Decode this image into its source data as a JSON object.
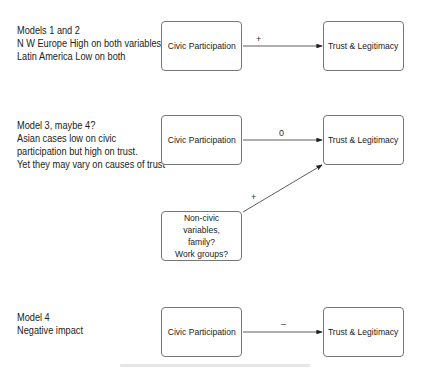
{
  "models": [
    {
      "note": "Models 1 and 2\nN W Europe High on both variables\nLatin America  Low on both",
      "source_label": "Civic Participation",
      "target_label": "Trust & Legitimacy",
      "edge_label": "+"
    },
    {
      "note": "Model 3, maybe 4?\nAsian cases low on civic\nparticipation but high on trust.\nYet they may vary on causes of trust",
      "source_label": "Civic Participation",
      "target_label": "Trust & Legitimacy",
      "edge_label": "0",
      "extra_source_label": "Non-civic variables,\nfamily?\nWork groups?",
      "extra_edge_label": "+"
    },
    {
      "note": "Model 4\nNegative impact",
      "source_label": "Civic Participation",
      "target_label": "Trust & Legitimacy",
      "edge_label": "–"
    }
  ]
}
